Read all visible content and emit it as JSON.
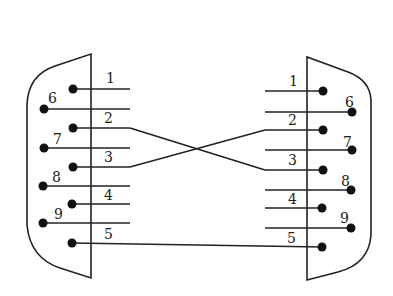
{
  "diagram": {
    "left_connector": {
      "pins": [
        {
          "num": "1",
          "label": "1",
          "x": 73,
          "y": 89,
          "row": "top"
        },
        {
          "num": "6",
          "label": "6",
          "x": 44,
          "y": 109,
          "row": "bottom"
        },
        {
          "num": "2",
          "label": "2",
          "x": 73,
          "y": 128,
          "row": "top"
        },
        {
          "num": "7",
          "label": "7",
          "x": 44,
          "y": 148,
          "row": "bottom"
        },
        {
          "num": "3",
          "label": "3",
          "x": 73,
          "y": 167,
          "row": "top"
        },
        {
          "num": "8",
          "label": "8",
          "x": 43,
          "y": 186,
          "row": "bottom"
        },
        {
          "num": "4",
          "label": "4",
          "x": 72,
          "y": 204,
          "row": "top"
        },
        {
          "num": "9",
          "label": "9",
          "x": 43,
          "y": 223,
          "row": "bottom"
        },
        {
          "num": "5",
          "label": "5",
          "x": 72,
          "y": 243,
          "row": "top"
        }
      ]
    },
    "right_connector": {
      "pins": [
        {
          "num": "1",
          "label": "1",
          "x": 323,
          "y": 91,
          "row": "top"
        },
        {
          "num": "6",
          "label": "6",
          "x": 352,
          "y": 112,
          "row": "bottom"
        },
        {
          "num": "2",
          "label": "2",
          "x": 323,
          "y": 130,
          "row": "top"
        },
        {
          "num": "7",
          "label": "7",
          "x": 352,
          "y": 150,
          "row": "bottom"
        },
        {
          "num": "3",
          "label": "3",
          "x": 323,
          "y": 170,
          "row": "top"
        },
        {
          "num": "8",
          "label": "8",
          "x": 351,
          "y": 190,
          "row": "bottom"
        },
        {
          "num": "4",
          "label": "4",
          "x": 322,
          "y": 208,
          "row": "top"
        },
        {
          "num": "9",
          "label": "9",
          "x": 351,
          "y": 228,
          "row": "bottom"
        },
        {
          "num": "5",
          "label": "5",
          "x": 322,
          "y": 247,
          "row": "top"
        }
      ]
    },
    "connections": [
      {
        "from": "L2",
        "to": "R3",
        "type": "crossover"
      },
      {
        "from": "L3",
        "to": "R2",
        "type": "crossover"
      },
      {
        "from": "L5",
        "to": "R5",
        "type": "straight"
      }
    ]
  }
}
